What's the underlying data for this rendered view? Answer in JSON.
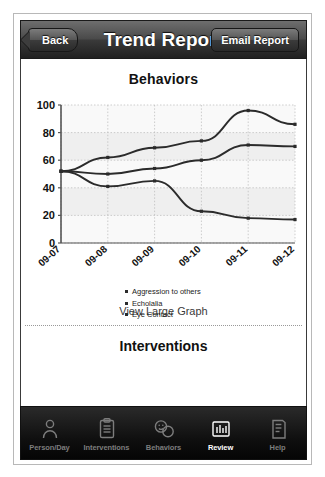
{
  "nav": {
    "back_label": "Back",
    "title": "Trend Report",
    "email_label": "Email Report",
    "back_icon": "chevron-left-icon"
  },
  "main": {
    "behaviors_heading": "Behaviors",
    "view_large_graph_label": "View Large Graph",
    "interventions_heading": "Interventions"
  },
  "chart_data": {
    "type": "line",
    "title": "Behaviors",
    "xlabel": "",
    "ylabel": "",
    "ylim": [
      0,
      100
    ],
    "yticks": [
      0,
      20,
      40,
      60,
      80,
      100
    ],
    "grid": true,
    "legend_position": "below",
    "categories": [
      "09-07",
      "09-08",
      "09-09",
      "09-10",
      "09-11",
      "09-12"
    ],
    "series": [
      {
        "name": "Aggression to others",
        "values": [
          52,
          62,
          69,
          74,
          96,
          86
        ]
      },
      {
        "name": "Echolalia",
        "values": [
          52,
          50,
          54,
          60,
          71,
          70
        ]
      },
      {
        "name": "Eye Contact",
        "values": [
          52,
          41,
          45,
          23,
          18,
          17
        ]
      }
    ]
  },
  "tabs": [
    {
      "label": "Person/Day",
      "icon": "person-icon",
      "active": false
    },
    {
      "label": "Interventions",
      "icon": "clipboard-icon",
      "active": false
    },
    {
      "label": "Behaviors",
      "icon": "faces-icon",
      "active": false
    },
    {
      "label": "Review",
      "icon": "bar-chart-icon",
      "active": true
    },
    {
      "label": "Help",
      "icon": "book-icon",
      "active": false
    }
  ],
  "colors": {
    "line": "#2b2b2b",
    "plot_band": "#e9e9e9",
    "nav_dark": "#2a2a2a"
  }
}
